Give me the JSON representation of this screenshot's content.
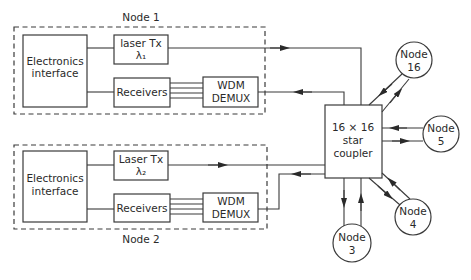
{
  "diagram": {
    "type": "WDM broadcast-and-select network",
    "nodes_groups": [
      {
        "label": "Node 1",
        "electronics": [
          "Electronics",
          "interface"
        ],
        "laser": "laser Tx",
        "wavelength": "λ₁",
        "receivers": "Receivers",
        "demux": [
          "WDM",
          "DEMUX"
        ]
      },
      {
        "label": "Node 2",
        "electronics": [
          "Electronics",
          "interface"
        ],
        "laser": "Laser Tx",
        "wavelength": "λ₂",
        "receivers": "Receivers",
        "demux": [
          "WDM",
          "DEMUX"
        ]
      }
    ],
    "coupler": [
      "16 × 16",
      "star",
      "coupler"
    ],
    "remote_nodes": [
      {
        "line1": "Node",
        "line2": "16"
      },
      {
        "line1": "Node",
        "line2": "5"
      },
      {
        "line1": "Node",
        "line2": "4"
      },
      {
        "line1": "Node",
        "line2": "3"
      }
    ]
  }
}
